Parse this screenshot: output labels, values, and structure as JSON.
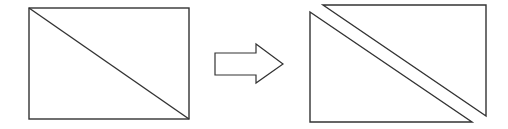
{
  "diagram": {
    "stroke_color": "#333333",
    "background": "#ffffff",
    "left_figure": {
      "shape": "rectangle-with-diagonal",
      "rect": {
        "x": 29,
        "y": 8,
        "width": 160,
        "height": 111
      },
      "diagonal": {
        "x1": 29,
        "y1": 8,
        "x2": 189,
        "y2": 119
      }
    },
    "arrow": {
      "shape": "block-arrow-right",
      "points": "215,53 256,53 256,44 283,64 256,83 256,75 215,75"
    },
    "right_figure": {
      "lower_triangle": {
        "points": "310,12 472,122 310,122"
      },
      "upper_triangle": {
        "points": "323,5 486,5 486,116"
      }
    }
  }
}
